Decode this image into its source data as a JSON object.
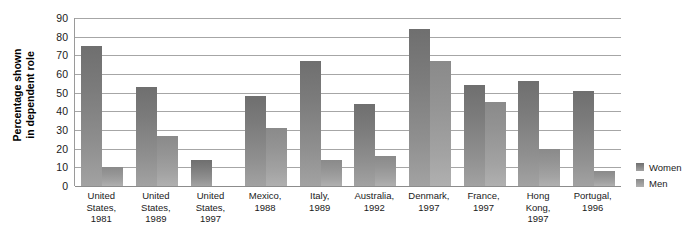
{
  "chart_data": {
    "type": "bar",
    "title": "",
    "subtitle": "",
    "xlabel": "",
    "ylabel": "Percentage shown\nin dependent role",
    "ylabel_line1": "Percentage shown",
    "ylabel_line2": "in dependent role",
    "ylim": [
      0,
      90
    ],
    "yticks": [
      0,
      10,
      20,
      30,
      40,
      50,
      60,
      70,
      80,
      90
    ],
    "ytick_labels": [
      "0",
      "10",
      "20",
      "30",
      "40",
      "50",
      "60",
      "70",
      "80",
      "90"
    ],
    "grid": true,
    "grid_axis": "y",
    "legend_position": "right",
    "categories": [
      "United States, 1981",
      "United States, 1989",
      "United States, 1997",
      "Mexico, 1988",
      "Italy, 1989",
      "Australia, 1992",
      "Denmark, 1997",
      "France, 1997",
      "Hong Kong, 1997",
      "Portugal, 1996"
    ],
    "category_lines": [
      [
        "United",
        "States,",
        "1981"
      ],
      [
        "United",
        "States,",
        "1989"
      ],
      [
        "United",
        "States,",
        "1997"
      ],
      [
        "Mexico,",
        "1988"
      ],
      [
        "Italy,",
        "1989"
      ],
      [
        "Australia,",
        "1992"
      ],
      [
        "Denmark,",
        "1997"
      ],
      [
        "France,",
        "1997"
      ],
      [
        "Hong",
        "Kong,",
        "1997"
      ],
      [
        "Portugal,",
        "1996"
      ]
    ],
    "series": [
      {
        "name": "Women",
        "color": "#7d7d7d",
        "values": [
          75,
          53,
          14,
          48,
          67,
          44,
          84,
          54,
          56,
          51
        ]
      },
      {
        "name": "Men",
        "color": "#9b9b9b",
        "values": [
          10,
          27,
          0,
          31,
          14,
          16,
          67,
          45,
          20,
          8
        ]
      }
    ]
  },
  "legend": {
    "items": [
      {
        "label": "Women",
        "swatch": "women"
      },
      {
        "label": "Men",
        "swatch": "men"
      }
    ]
  }
}
